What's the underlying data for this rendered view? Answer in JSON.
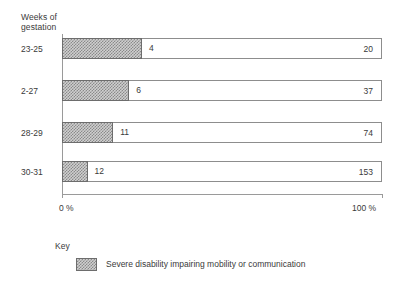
{
  "chart_data": {
    "type": "bar",
    "orientation": "horizontal",
    "stacked": true,
    "title": "",
    "xlabel": "",
    "ylabel": "Weeks of gestation",
    "ylabel_lines": [
      "Weeks of",
      "gestation"
    ],
    "categories": [
      "23-25",
      "2-27",
      "28-29",
      "30-31"
    ],
    "xlim": [
      0,
      100
    ],
    "x_tick_labels": [
      "0 %",
      "100 %"
    ],
    "grid": false,
    "legend_position": "bottom-left",
    "legend_title": "Key",
    "series": [
      {
        "name": "Severe disability impairing mobility or communication",
        "pattern": "checkerboard-hatch",
        "counts": [
          4,
          6,
          11,
          12
        ],
        "percent_of_bar": [
          25,
          21,
          16,
          8
        ]
      },
      {
        "name": "Total survivors",
        "pattern": "open",
        "counts": [
          20,
          37,
          74,
          153
        ],
        "percent_of_bar": [
          100,
          100,
          100,
          100
        ]
      }
    ],
    "rows": [
      {
        "category": "23-25",
        "segment_value": "4",
        "segment_percent": 25,
        "total_value": "20"
      },
      {
        "category": "2-27",
        "segment_value": "6",
        "segment_percent": 21,
        "total_value": "37"
      },
      {
        "category": "28-29",
        "segment_value": "11",
        "segment_percent": 16,
        "total_value": "74"
      },
      {
        "category": "30-31",
        "segment_value": "12",
        "segment_percent": 8,
        "total_value": "153"
      }
    ],
    "colors": {
      "bar_outline": "#8d8d8d",
      "segment_outline": "#6d6d6d",
      "segment_fill": "#cfcfcf",
      "segment_hatch": "#8a8a8a",
      "axis": "#9a9a9a",
      "text": "#3a3a3a",
      "background": "#ffffff"
    }
  },
  "axis": {
    "y_title_line1": "Weeks of",
    "y_title_line2": "gestation",
    "x_min_label": "0 %",
    "x_max_label": "100 %"
  },
  "key": {
    "title": "Key",
    "entries": [
      {
        "label": "Severe disability impairing mobility or communication"
      }
    ]
  }
}
